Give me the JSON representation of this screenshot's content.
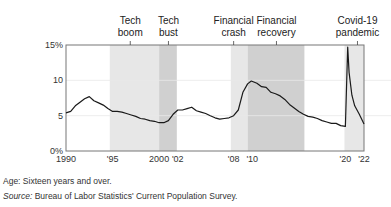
{
  "chart_data": {
    "type": "line",
    "title": "",
    "xlabel": "",
    "ylabel": "",
    "ylim": [
      0,
      15
    ],
    "xlim": [
      1990,
      2022
    ],
    "y_ticks": [
      {
        "v": 0,
        "label": "0%"
      },
      {
        "v": 5,
        "label": "5"
      },
      {
        "v": 10,
        "label": "10"
      },
      {
        "v": 15,
        "label": "15%"
      }
    ],
    "x_ticks": [
      {
        "v": 1990,
        "label": "1990"
      },
      {
        "v": 1995,
        "label": "'95"
      },
      {
        "v": 2000,
        "label": "2000"
      },
      {
        "v": 2002,
        "label": "'02"
      },
      {
        "v": 2008,
        "label": "'08"
      },
      {
        "v": 2010,
        "label": "'10"
      },
      {
        "v": 2020,
        "label": "'20"
      },
      {
        "v": 2022,
        "label": "'22"
      }
    ],
    "grid": true,
    "series": [
      {
        "name": "Unemployment rate",
        "x": [
          1990.0,
          1990.5,
          1991.0,
          1991.5,
          1992.0,
          1992.5,
          1993.0,
          1993.5,
          1994.0,
          1994.5,
          1995.0,
          1995.5,
          1996.0,
          1996.5,
          1997.0,
          1997.5,
          1998.0,
          1998.5,
          1999.0,
          1999.5,
          2000.0,
          2000.5,
          2001.0,
          2001.5,
          2002.0,
          2002.5,
          2003.0,
          2003.5,
          2004.0,
          2004.5,
          2005.0,
          2005.5,
          2006.0,
          2006.5,
          2007.0,
          2007.5,
          2008.0,
          2008.5,
          2009.0,
          2009.5,
          2009.9,
          2010.5,
          2011.0,
          2011.5,
          2012.0,
          2012.5,
          2013.0,
          2013.5,
          2014.0,
          2014.5,
          2015.0,
          2015.5,
          2016.0,
          2016.5,
          2017.0,
          2017.5,
          2018.0,
          2018.5,
          2019.0,
          2019.5,
          2020.0,
          2020.25,
          2020.4,
          2020.7,
          2021.0,
          2021.5,
          2022.0
        ],
        "values": [
          5.4,
          5.6,
          6.4,
          6.9,
          7.4,
          7.7,
          7.1,
          6.8,
          6.5,
          6.0,
          5.6,
          5.6,
          5.5,
          5.3,
          5.1,
          4.9,
          4.6,
          4.5,
          4.3,
          4.2,
          4.0,
          4.0,
          4.3,
          5.2,
          5.8,
          5.8,
          6.0,
          6.2,
          5.7,
          5.5,
          5.3,
          5.0,
          4.7,
          4.5,
          4.6,
          4.7,
          5.0,
          5.8,
          8.3,
          9.5,
          9.9,
          9.6,
          9.1,
          9.0,
          8.3,
          8.1,
          7.8,
          7.3,
          6.6,
          6.1,
          5.6,
          5.2,
          4.9,
          4.8,
          4.6,
          4.3,
          4.1,
          3.9,
          3.9,
          3.6,
          3.5,
          14.7,
          11.1,
          7.9,
          6.4,
          5.2,
          3.8
        ]
      }
    ],
    "shaded_periods": [
      {
        "label": "Tech boom",
        "start": 1994.7,
        "end": 2000.0,
        "label_x": 1996.9,
        "shade": "light"
      },
      {
        "label": "Tech bust",
        "start": 2000.0,
        "end": 2001.9,
        "label_x": 2001.0,
        "shade": "dark"
      },
      {
        "label": "Financial crash",
        "start": 2007.7,
        "end": 2009.5,
        "label_x": 2008.0,
        "shade": "light"
      },
      {
        "label": "Financial recovery",
        "start": 2009.5,
        "end": 2015.6,
        "label_x": 2012.6,
        "shade": "dark"
      },
      {
        "label": "Covid-19 pandemic",
        "start": 2019.9,
        "end": 2022.0,
        "label_x": 2021.3,
        "shade": "light"
      }
    ],
    "annotations": [
      "Tech boom",
      "Tech bust",
      "Financial crash",
      "Financial recovery",
      "Covid-19 pandemic"
    ]
  },
  "colors": {
    "light_shade": "#e7e7e7",
    "dark_shade": "#d0d0d0",
    "line": "#1a1a1a",
    "axis": "#777777",
    "grid": "#e9e9e9"
  },
  "notes": {
    "age": "Age: Sixteen years and over.",
    "source_label": "Source:",
    "source_text": " Bureau of Labor Statistics' Current Population Survey."
  }
}
